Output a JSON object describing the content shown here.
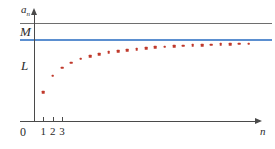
{
  "chart_data": {
    "type": "scatter",
    "title": "",
    "subtitle": "",
    "xlabel": "n",
    "ylabel": "a_n",
    "grid": false,
    "legend": null,
    "xlim": [
      0,
      24
    ],
    "ylim": [
      0,
      1.18
    ],
    "xticks": [
      1,
      2,
      3
    ],
    "xticklabels": [
      "1",
      "2",
      "3"
    ],
    "yticks": [],
    "yticklabels": [],
    "origin_label": "0",
    "annotations": [
      {
        "name": "M",
        "text": "M",
        "type": "horizontal-line-label",
        "value": 1.08
      },
      {
        "name": "L",
        "text": "L",
        "type": "horizontal-line-label",
        "value": 0.9
      }
    ],
    "reference_lines": [
      {
        "name": "M",
        "label": "M",
        "y": 1.08,
        "color": "#6e6e6e",
        "style": "solid"
      },
      {
        "name": "L",
        "label": "L",
        "y": 0.9,
        "color": "#5b8fd0",
        "style": "solid"
      }
    ],
    "series": [
      {
        "name": "a_n",
        "marker": "square-dot",
        "color": "#c0392b",
        "x": [
          1,
          2,
          3,
          4,
          5,
          6,
          7,
          8,
          9,
          10,
          11,
          12,
          13,
          14,
          15,
          16,
          17,
          18,
          19,
          20,
          21,
          22,
          23
        ],
        "y": [
          0.315,
          0.5,
          0.59,
          0.645,
          0.685,
          0.715,
          0.738,
          0.756,
          0.771,
          0.784,
          0.794,
          0.803,
          0.811,
          0.818,
          0.824,
          0.829,
          0.834,
          0.838,
          0.842,
          0.845,
          0.848,
          0.851,
          0.854
        ]
      }
    ]
  },
  "figure": {
    "y_axis_label": "a",
    "y_axis_sub": "n",
    "x_axis_label": "n",
    "origin": "0",
    "line_M_label": "M",
    "line_L_label": "L",
    "colors": {
      "axis": "#4a4a4a",
      "line_M": "#6e6e6e",
      "line_L": "#5b8fd0",
      "dots": "#c0392b",
      "background": "#ffffff"
    }
  }
}
